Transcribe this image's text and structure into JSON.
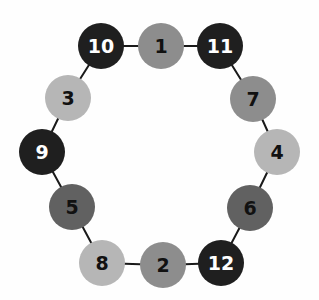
{
  "figure": {
    "background_color": "#fefefe",
    "edge_color": "#1a1a1a",
    "edge_width": 2,
    "node_radius": 23,
    "palette": {
      "black": "#1f1f1f",
      "dark_gray": "#616161",
      "medium_gray": "#8d8d8d",
      "light_gray": "#b6b6b6"
    },
    "label_color_on_dark": "#ffffff",
    "label_color_on_light": "#111111",
    "nodes": [
      {
        "id": 1,
        "label": "1",
        "x": 161,
        "y": 46,
        "color": "medium_gray",
        "text_color": "#111111"
      },
      {
        "id": 2,
        "label": "2",
        "x": 163,
        "y": 265,
        "color": "medium_gray",
        "text_color": "#111111"
      },
      {
        "id": 3,
        "label": "3",
        "x": 68,
        "y": 98,
        "color": "light_gray",
        "text_color": "#111111"
      },
      {
        "id": 4,
        "label": "4",
        "x": 277,
        "y": 152,
        "color": "light_gray",
        "text_color": "#111111"
      },
      {
        "id": 5,
        "label": "5",
        "x": 72,
        "y": 207,
        "color": "dark_gray",
        "text_color": "#111111"
      },
      {
        "id": 6,
        "label": "6",
        "x": 250,
        "y": 208,
        "color": "dark_gray",
        "text_color": "#111111"
      },
      {
        "id": 7,
        "label": "7",
        "x": 253,
        "y": 99,
        "color": "medium_gray",
        "text_color": "#111111"
      },
      {
        "id": 8,
        "label": "8",
        "x": 102,
        "y": 263,
        "color": "light_gray",
        "text_color": "#111111"
      },
      {
        "id": 9,
        "label": "9",
        "x": 42,
        "y": 152,
        "color": "black",
        "text_color": "#ffffff"
      },
      {
        "id": 10,
        "label": "10",
        "x": 101,
        "y": 46,
        "color": "black",
        "text_color": "#ffffff"
      },
      {
        "id": 11,
        "label": "11",
        "x": 220,
        "y": 46,
        "color": "black",
        "text_color": "#ffffff"
      },
      {
        "id": 12,
        "label": "12",
        "x": 221,
        "y": 263,
        "color": "black",
        "text_color": "#ffffff"
      }
    ],
    "edges": [
      [
        10,
        1
      ],
      [
        1,
        11
      ],
      [
        11,
        7
      ],
      [
        7,
        4
      ],
      [
        4,
        6
      ],
      [
        6,
        12
      ],
      [
        12,
        2
      ],
      [
        2,
        8
      ],
      [
        8,
        5
      ],
      [
        5,
        9
      ],
      [
        9,
        3
      ],
      [
        3,
        10
      ]
    ]
  }
}
